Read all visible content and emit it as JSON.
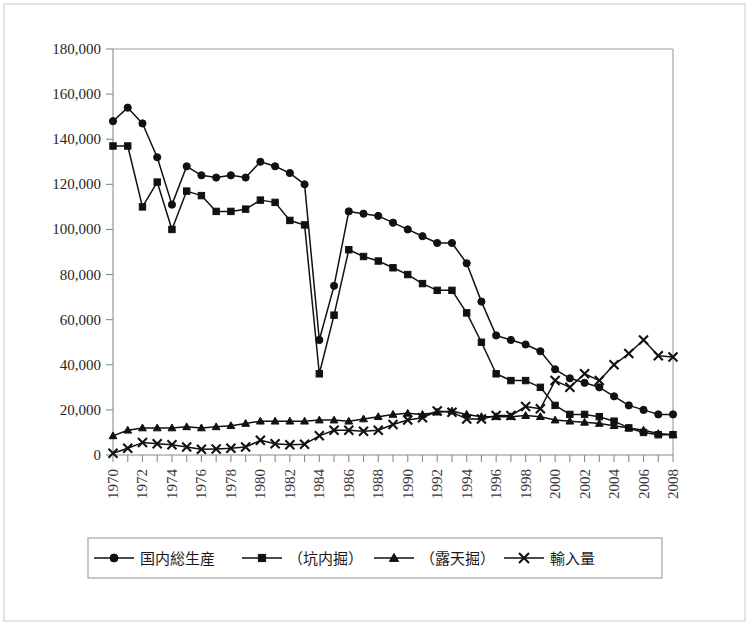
{
  "chart_data": {
    "type": "line",
    "title": "",
    "subtitle": "",
    "xlabel": "",
    "ylabel": "",
    "xlim": [
      1970,
      2008
    ],
    "ylim": [
      0,
      180000
    ],
    "grid": false,
    "legend_position": "bottom",
    "x": [
      1970,
      1971,
      1972,
      1973,
      1974,
      1975,
      1976,
      1977,
      1978,
      1979,
      1980,
      1981,
      1982,
      1983,
      1984,
      1985,
      1986,
      1987,
      1988,
      1989,
      1990,
      1991,
      1992,
      1993,
      1994,
      1995,
      1996,
      1997,
      1998,
      1999,
      2000,
      2001,
      2002,
      2003,
      2004,
      2005,
      2006,
      2007,
      2008
    ],
    "xtick_labels": [
      "1970",
      "1972",
      "1974",
      "1976",
      "1978",
      "1980",
      "1982",
      "1984",
      "1986",
      "1988",
      "1990",
      "1992",
      "1994",
      "1996",
      "1998",
      "2000",
      "2002",
      "2004",
      "2006",
      "2008"
    ],
    "ytick_labels": [
      "0",
      "20,000",
      "40,000",
      "60,000",
      "80,000",
      "100,000",
      "120,000",
      "140,000",
      "160,000",
      "180,000"
    ],
    "ytick_values": [
      0,
      20000,
      40000,
      60000,
      80000,
      100000,
      120000,
      140000,
      160000,
      180000
    ],
    "series": [
      {
        "name": "国内総生産",
        "marker": "circle",
        "color": "#111111",
        "values": [
          148000,
          154000,
          147000,
          132000,
          111000,
          128000,
          124000,
          123000,
          124000,
          123000,
          130000,
          128000,
          125000,
          120000,
          51000,
          75000,
          108000,
          107000,
          106000,
          103000,
          100000,
          97000,
          94000,
          94000,
          85000,
          68000,
          53000,
          51000,
          49000,
          46000,
          38000,
          34000,
          32000,
          30000,
          26000,
          22000,
          20000,
          18000,
          18000
        ]
      },
      {
        "name": "（坑内掘）",
        "marker": "square",
        "color": "#111111",
        "values": [
          137000,
          137000,
          110000,
          121000,
          100000,
          117000,
          115000,
          108000,
          108000,
          109000,
          113000,
          112000,
          104000,
          102000,
          36000,
          62000,
          91000,
          88000,
          86000,
          83000,
          80000,
          76000,
          73000,
          73000,
          63000,
          50000,
          36000,
          33000,
          33000,
          30000,
          22000,
          18000,
          18000,
          17000,
          15000,
          12000,
          10000,
          9000,
          9000
        ]
      },
      {
        "name": "（露天掘）",
        "marker": "triangle",
        "color": "#111111",
        "values": [
          8500,
          11000,
          12000,
          12000,
          12000,
          12500,
          12000,
          12500,
          13000,
          14000,
          15000,
          15000,
          15000,
          15000,
          15500,
          15500,
          15000,
          16000,
          17000,
          18000,
          18500,
          18000,
          19000,
          19500,
          18000,
          17000,
          17000,
          17000,
          17500,
          17000,
          15500,
          15000,
          14500,
          14000,
          13000,
          12000,
          11000,
          9500,
          9000
        ]
      },
      {
        "name": "輸入量",
        "marker": "cross",
        "color": "#111111",
        "values": [
          800,
          3000,
          5500,
          5000,
          4500,
          3500,
          2500,
          2700,
          3000,
          3500,
          6500,
          5000,
          4500,
          4800,
          8500,
          11000,
          11000,
          10500,
          11000,
          13500,
          15500,
          16500,
          19500,
          19000,
          16000,
          16000,
          17500,
          17500,
          21500,
          20500,
          33000,
          30000,
          36000,
          33000,
          40000,
          45000,
          51000,
          44000,
          43500
        ]
      }
    ]
  },
  "legend": {
    "items": [
      {
        "label": "国内総生産",
        "marker": "circle"
      },
      {
        "label": "（坑内掘）",
        "marker": "square"
      },
      {
        "label": "（露天掘）",
        "marker": "triangle"
      },
      {
        "label": "輸入量",
        "marker": "cross"
      }
    ]
  }
}
